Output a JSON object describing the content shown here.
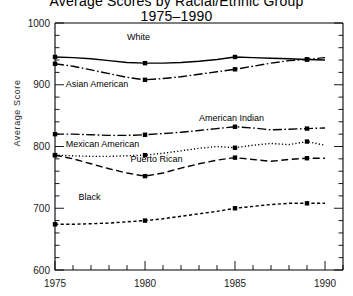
{
  "chart_data": {
    "type": "line",
    "title": "Average Scores by Racial/Ethnic Group",
    "title_line1": "Average Scores by Racial/Ethnic Group",
    "title_line2": "1975–1990",
    "xlabel": "",
    "ylabel": "Average Score",
    "ylim": [
      600,
      1000
    ],
    "xlim": [
      1975,
      1991
    ],
    "ytick_labels": [
      "1000",
      "900",
      "800",
      "700",
      "600"
    ],
    "ytick_values": [
      1000,
      900,
      800,
      700,
      600
    ],
    "xtick_labels": [
      "1975",
      "1980",
      "1985",
      "1990"
    ],
    "xtick_values": [
      1975,
      1980,
      1985,
      1990
    ],
    "grid": false,
    "legend_position": "inline-annotations",
    "x": [
      1975,
      1976,
      1977,
      1978,
      1979,
      1980,
      1981,
      1982,
      1983,
      1984,
      1985,
      1986,
      1987,
      1988,
      1989,
      1990
    ],
    "series": [
      {
        "name": "White",
        "style": "solid",
        "label_x": 1979.0,
        "label_y": 972,
        "values": [
          945,
          944,
          942,
          939,
          936,
          935,
          935,
          936,
          938,
          941,
          945,
          944,
          943,
          942,
          941,
          940
        ]
      },
      {
        "name": "Asian American",
        "style": "dashdot",
        "label_x": 1975.6,
        "label_y": 896,
        "values": [
          934,
          930,
          924,
          918,
          912,
          908,
          910,
          913,
          917,
          921,
          925,
          930,
          935,
          939,
          941,
          944
        ]
      },
      {
        "name": "American Indian",
        "style": "dashdot",
        "label_x": 1983.0,
        "label_y": 841,
        "values": [
          820,
          820,
          819,
          818,
          818,
          819,
          821,
          823,
          826,
          829,
          832,
          830,
          827,
          828,
          829,
          830
        ]
      },
      {
        "name": "Mexican American",
        "style": "dotted",
        "label_x": 1975.6,
        "label_y": 800,
        "values": [
          786,
          785,
          784,
          784,
          785,
          786,
          789,
          793,
          797,
          800,
          798,
          802,
          805,
          803,
          808,
          802
        ]
      },
      {
        "name": "Puerto Rican",
        "style": "dashed-long",
        "label_x": 1979.2,
        "label_y": 775,
        "values": [
          786,
          780,
          772,
          764,
          757,
          752,
          757,
          765,
          772,
          778,
          782,
          779,
          776,
          779,
          781,
          781
        ]
      },
      {
        "name": "Black",
        "style": "dashed-short",
        "label_x": 1976.3,
        "label_y": 713,
        "values": [
          674,
          674,
          675,
          676,
          678,
          680,
          683,
          687,
          691,
          695,
          700,
          703,
          706,
          708,
          708,
          708
        ]
      }
    ]
  }
}
